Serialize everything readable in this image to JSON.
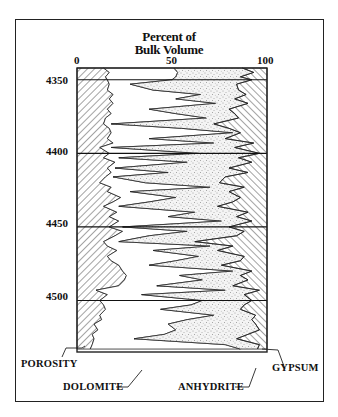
{
  "chart_data": {
    "type": "area",
    "title_lines": [
      "Percent of",
      "Bulk Volume"
    ],
    "xlabel": "Percent of Bulk Volume",
    "ylabel": "Depth",
    "xlim": [
      0,
      100
    ],
    "ylim": [
      4342,
      4535
    ],
    "x_ticks": [
      "0",
      "50",
      "100"
    ],
    "y_ticks": [
      "4350",
      "4400",
      "4450",
      "4500"
    ],
    "grid": false,
    "legend_position": "annotations",
    "annotations": [
      "POROSITY",
      "DOLOMITE",
      "ANHYDRITE",
      "GYPSUM"
    ],
    "depth": [
      4342,
      4345,
      4348,
      4350,
      4353,
      4357,
      4360,
      4363,
      4366,
      4370,
      4373,
      4376,
      4380,
      4383,
      4386,
      4390,
      4393,
      4396,
      4400,
      4403,
      4406,
      4410,
      4413,
      4416,
      4420,
      4423,
      4426,
      4430,
      4433,
      4436,
      4440,
      4443,
      4446,
      4450,
      4453,
      4456,
      4460,
      4463,
      4466,
      4470,
      4473,
      4476,
      4480,
      4483,
      4486,
      4490,
      4493,
      4496,
      4500,
      4503,
      4506,
      4510,
      4513,
      4516,
      4520,
      4523,
      4526,
      4530,
      4533
    ],
    "series": [
      {
        "name": "POROSITY",
        "values": [
          14,
          17,
          15,
          16,
          17,
          16,
          19,
          17,
          19,
          16,
          18,
          15,
          14,
          17,
          18,
          16,
          19,
          12,
          17,
          14,
          20,
          16,
          18,
          15,
          12,
          18,
          16,
          23,
          19,
          14,
          21,
          17,
          22,
          17,
          24,
          20,
          14,
          16,
          21,
          16,
          18,
          22,
          24,
          26,
          25,
          22,
          10,
          16,
          12,
          14,
          15,
          12,
          13,
          9,
          11,
          8,
          9,
          8,
          7
        ]
      },
      {
        "name": "DOLOMITE",
        "values": [
          51,
          53,
          52,
          50,
          28,
          40,
          65,
          52,
          73,
          38,
          52,
          68,
          16,
          55,
          82,
          38,
          72,
          18,
          64,
          22,
          58,
          16,
          48,
          12,
          36,
          70,
          28,
          52,
          38,
          22,
          62,
          48,
          76,
          24,
          58,
          38,
          22,
          70,
          40,
          64,
          52,
          38,
          82,
          54,
          66,
          42,
          78,
          34,
          66,
          60,
          44,
          72,
          58,
          48,
          52,
          46,
          30,
          78,
          86
        ]
      },
      {
        "name": "ANHYDRITE",
        "values": [
          87,
          93,
          86,
          92,
          84,
          85,
          89,
          83,
          90,
          80,
          83,
          85,
          72,
          80,
          86,
          78,
          93,
          83,
          96,
          85,
          92,
          80,
          90,
          78,
          75,
          88,
          80,
          86,
          82,
          74,
          90,
          84,
          92,
          80,
          88,
          84,
          62,
          82,
          74,
          88,
          86,
          76,
          92,
          86,
          90,
          82,
          96,
          88,
          92,
          88,
          86,
          94,
          92,
          94,
          96,
          90,
          84,
          96,
          95
        ]
      },
      {
        "name": "GYPSUM",
        "values": [
          13,
          7,
          14,
          8,
          16,
          15,
          11,
          17,
          10,
          20,
          17,
          15,
          28,
          20,
          14,
          22,
          7,
          17,
          4,
          15,
          8,
          20,
          10,
          22,
          25,
          12,
          20,
          14,
          18,
          26,
          10,
          16,
          8,
          20,
          12,
          16,
          38,
          18,
          26,
          12,
          14,
          24,
          8,
          14,
          10,
          18,
          4,
          12,
          8,
          12,
          14,
          6,
          8,
          6,
          4,
          10,
          16,
          4,
          5
        ]
      }
    ]
  },
  "figure": {
    "title_line1": "Percent of",
    "title_line2": "Bulk Volume",
    "x_tick_0": "0",
    "x_tick_50": "50",
    "x_tick_100": "100",
    "y_tick_4350": "4350",
    "y_tick_4400": "4400",
    "y_tick_4450": "4450",
    "y_tick_4500": "4500",
    "label_porosity": "POROSITY",
    "label_dolomite": "DOLOMITE",
    "label_anhydrite": "ANHYDRITE",
    "label_gypsum": "GYPSUM"
  }
}
